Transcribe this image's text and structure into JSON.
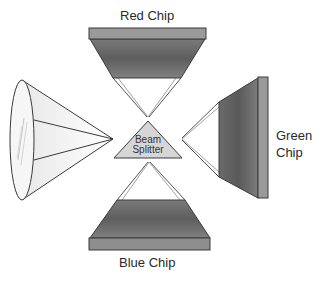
{
  "diagram": {
    "type": "three-chip beam splitter optical diagram",
    "labels": {
      "red_chip": "Red Chip",
      "green_chip_line1": "Green",
      "green_chip_line2": "Chip",
      "blue_chip": "Blue Chip",
      "beam_splitter_line1": "Beam",
      "beam_splitter_line2": "Splitter"
    },
    "components": [
      {
        "id": "lens",
        "name": "Lens",
        "position": "left"
      },
      {
        "id": "beam-splitter",
        "name": "Beam Splitter",
        "position": "center"
      },
      {
        "id": "red-chip",
        "name": "Red Chip",
        "position": "top"
      },
      {
        "id": "green-chip",
        "name": "Green Chip",
        "position": "right"
      },
      {
        "id": "blue-chip",
        "name": "Blue Chip",
        "position": "bottom"
      }
    ],
    "colors": {
      "chip_dark": "#6e6e6e",
      "chip_bar": "#9a9a9a",
      "outline": "#3a3a3a",
      "splitter_fill": "#d6d6d6",
      "lens_fill": "#f4f4f4"
    }
  }
}
